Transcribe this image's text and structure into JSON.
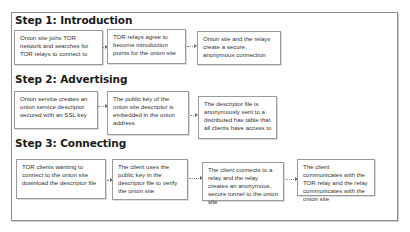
{
  "diagram": {
    "steps": [
      {
        "title": "Step 1: Introduction",
        "boxes": [
          "Onion site joins TOR network and searches for TOR relays to connect to",
          "TOR relays agree to become introduction points for the onion site",
          "Onion site and the relays create a secure, anonymous connection"
        ]
      },
      {
        "title": "Step 2: Advertising",
        "boxes": [
          "Onion service creates an onion service descriptor secured with an SSL key",
          "The public key of the onion site descriptor is embedded in the onion address",
          "The descriptor file is anonymously sent to a distributed has table that all clients have access to"
        ]
      },
      {
        "title": "Step 3: Connecting",
        "boxes": [
          "TOR clients wanting to connect to the onion site download the descriptor file",
          "The client uses the public key in the descriptor file to verify the onion site",
          "The client connects to a relay and the relay creates an anonymous, secure tunnel to the onion site",
          "The client communicates with the TOR relay and the relay communicates with the onion site"
        ]
      }
    ],
    "colors": {
      "frame_border": "#8c8c8c",
      "box_border": "#9a9a9a",
      "text": "#333333",
      "heading": "#1a1a1a"
    }
  }
}
